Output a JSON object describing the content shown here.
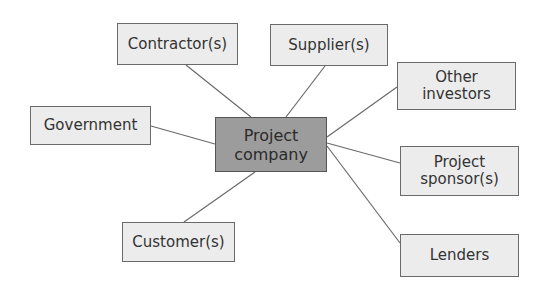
{
  "diagram": {
    "center": {
      "id": "project_company",
      "label": "Project\ncompany",
      "color": "#9c9c9c"
    },
    "nodes": [
      {
        "id": "contractors",
        "label": "Contractor(s)"
      },
      {
        "id": "suppliers",
        "label": "Supplier(s)"
      },
      {
        "id": "other_investors",
        "label": "Other\ninvestors"
      },
      {
        "id": "government",
        "label": "Government"
      },
      {
        "id": "project_sponsors",
        "label": "Project\nsponsor(s)"
      },
      {
        "id": "customers",
        "label": "Customer(s)"
      },
      {
        "id": "lenders",
        "label": "Lenders"
      }
    ],
    "edges": [
      {
        "from": "project_company",
        "to": "contractors"
      },
      {
        "from": "project_company",
        "to": "suppliers"
      },
      {
        "from": "project_company",
        "to": "other_investors"
      },
      {
        "from": "project_company",
        "to": "government"
      },
      {
        "from": "project_company",
        "to": "project_sponsors"
      },
      {
        "from": "project_company",
        "to": "customers"
      },
      {
        "from": "project_company",
        "to": "lenders"
      }
    ],
    "node_color": "#ececec",
    "line_color": "#6a6a6a"
  }
}
